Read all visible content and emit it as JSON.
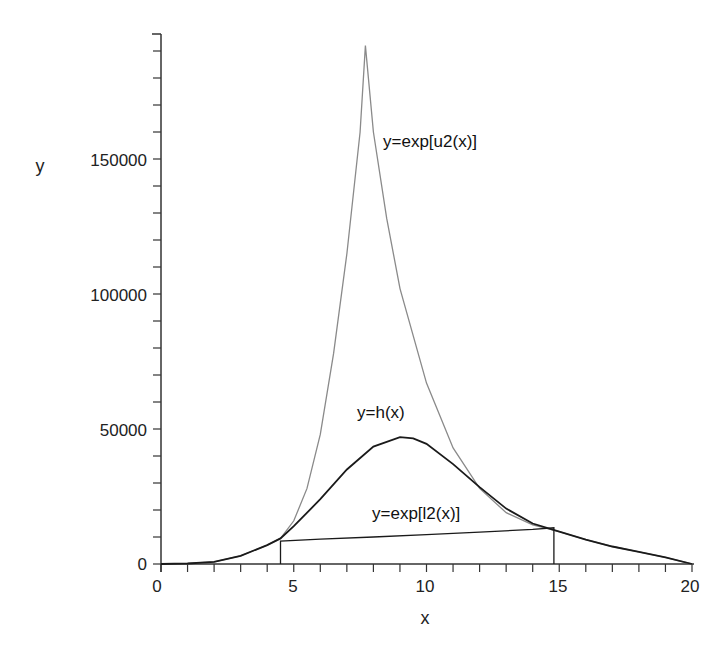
{
  "chart_data": {
    "type": "line",
    "title": "",
    "xlabel": "x",
    "ylabel": "y",
    "xlim": [
      0,
      20
    ],
    "ylim": [
      0,
      190000
    ],
    "grid": false,
    "legend": "inline labels",
    "x_ticks": [
      "0",
      "5",
      "10",
      "15",
      "20"
    ],
    "y_ticks": [
      "0",
      "50000",
      "100000",
      "150000"
    ],
    "series": [
      {
        "name": "y=exp[u2(x)]",
        "role": "upper envelope",
        "color": "#8a8a8a",
        "x": [
          0,
          1,
          2,
          3,
          4,
          4.5,
          5,
          5.5,
          6,
          6.5,
          7,
          7.5,
          7.7,
          8,
          8.5,
          9,
          10,
          11,
          12,
          13,
          14,
          15,
          16,
          17,
          18,
          19,
          20
        ],
        "y": [
          0,
          200,
          800,
          3000,
          7000,
          9500,
          16000,
          28000,
          48000,
          78000,
          115000,
          160000,
          192000,
          160000,
          128000,
          102000,
          67000,
          43000,
          28000,
          19000,
          14500,
          12000,
          9000,
          6500,
          4500,
          2500,
          0
        ]
      },
      {
        "name": "y=h(x)",
        "role": "target density",
        "color": "#1a1a1a",
        "x": [
          0,
          1,
          2,
          3,
          4,
          4.5,
          5,
          6,
          7,
          8,
          9,
          9.5,
          10,
          11,
          12,
          13,
          14,
          15,
          16,
          17,
          18,
          19,
          20
        ],
        "y": [
          0,
          200,
          800,
          3000,
          7000,
          9500,
          14000,
          24000,
          35000,
          43500,
          47000,
          46500,
          44500,
          37000,
          28500,
          20500,
          15000,
          12000,
          9000,
          6500,
          4500,
          2500,
          0
        ]
      },
      {
        "name": "y=exp[l2(x)]",
        "role": "lower squeeze",
        "color": "#1a1a1a",
        "x": [
          4.5,
          4.5,
          6,
          8,
          10,
          12,
          14,
          14.8,
          14.8
        ],
        "y": [
          0,
          8500,
          9200,
          10000,
          10900,
          11800,
          12800,
          13400,
          0
        ]
      }
    ],
    "annotations": [
      {
        "text": "y=exp[u2(x)]",
        "x": 8.3,
        "y": 157000
      },
      {
        "text": "y=h(x)",
        "x": 7.5,
        "y": 55000
      },
      {
        "text": "y=exp[l2(x)]",
        "x": 8.1,
        "y": 19000
      }
    ]
  },
  "labels": {
    "xlabel": "x",
    "ylabel": "y",
    "x_ticks": [
      "0",
      "5",
      "10",
      "15",
      "20"
    ],
    "y_ticks": [
      "0",
      "50000",
      "100000",
      "150000"
    ],
    "u2_label": "y=exp[u2(x)]",
    "h_label": "y=h(x)",
    "l2_label": "y=exp[l2(x)]"
  }
}
